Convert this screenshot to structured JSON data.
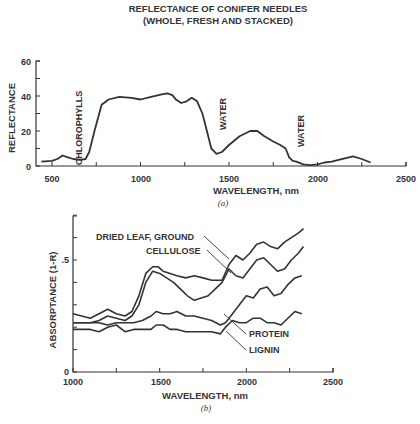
{
  "chart_data": [
    {
      "type": "line",
      "panel": "(a)",
      "title": "REFLECTANCE OF CONIFER NEEDLES",
      "subtitle": "(WHOLE, FRESH AND STACKED)",
      "xlabel": "WAVELENGTH, nm",
      "ylabel": "REFLECTANCE",
      "xlim": [
        400,
        2500
      ],
      "ylim": [
        0,
        60
      ],
      "xticks": [
        500,
        1000,
        1500,
        2000,
        2500
      ],
      "yticks": [
        0,
        20,
        40,
        60
      ],
      "grid": false,
      "annotations": [
        {
          "text": "CHLOROPHYLLS",
          "x": 680,
          "y": 12
        },
        {
          "text": "WATER",
          "x": 1420,
          "y": 18
        },
        {
          "text": "WATER",
          "x": 1900,
          "y": 12
        }
      ],
      "series": [
        {
          "name": "Conifer needles reflectance",
          "x": [
            440,
            500,
            530,
            560,
            590,
            620,
            660,
            690,
            710,
            740,
            780,
            820,
            880,
            950,
            1000,
            1060,
            1120,
            1150,
            1180,
            1200,
            1230,
            1260,
            1290,
            1320,
            1350,
            1380,
            1400,
            1430,
            1460,
            1500,
            1560,
            1620,
            1660,
            1700,
            1750,
            1790,
            1820,
            1840,
            1860,
            1880,
            1920,
            1960,
            2000,
            2040,
            2080,
            2120,
            2160,
            2200,
            2250,
            2300
          ],
          "y": [
            2.5,
            3,
            4,
            6,
            5,
            4,
            3.5,
            4,
            8,
            20,
            35,
            38,
            39.5,
            39,
            38,
            39.5,
            41,
            41.5,
            40.5,
            38,
            36,
            37,
            39,
            37,
            30,
            18,
            10,
            7,
            8,
            12,
            17,
            20,
            20,
            17,
            14,
            12,
            10,
            5,
            3,
            2.5,
            1,
            0.5,
            1,
            2,
            2.5,
            3.5,
            4.5,
            5.5,
            4,
            2
          ]
        }
      ]
    },
    {
      "type": "line",
      "panel": "(b)",
      "xlabel": "WAVELENGTH, nm",
      "ylabel": "ABSORPTANCE (1-R)",
      "xlim": [
        1000,
        2500
      ],
      "ylim": [
        0,
        0.75
      ],
      "xticks": [
        1000,
        1500,
        2000,
        2500
      ],
      "xminor": [
        1250,
        1750,
        2250
      ],
      "yticks": [
        0,
        0.5
      ],
      "ytick_labels": [
        "0",
        ".5"
      ],
      "grid": false,
      "legend": "inline leader-line labels",
      "series": [
        {
          "name": "DRIED LEAF, GROUND",
          "x": [
            1000,
            1050,
            1100,
            1150,
            1200,
            1250,
            1300,
            1340,
            1380,
            1420,
            1460,
            1490,
            1520,
            1560,
            1600,
            1650,
            1700,
            1750,
            1800,
            1860,
            1900,
            1940,
            1980,
            2020,
            2060,
            2100,
            2140,
            2180,
            2220,
            2260,
            2300,
            2330
          ],
          "y": [
            0.26,
            0.25,
            0.24,
            0.26,
            0.28,
            0.26,
            0.25,
            0.27,
            0.34,
            0.44,
            0.47,
            0.47,
            0.45,
            0.44,
            0.43,
            0.42,
            0.43,
            0.42,
            0.41,
            0.41,
            0.48,
            0.52,
            0.5,
            0.53,
            0.57,
            0.58,
            0.56,
            0.55,
            0.58,
            0.6,
            0.62,
            0.64
          ]
        },
        {
          "name": "CELLULOSE",
          "x": [
            1000,
            1050,
            1100,
            1150,
            1200,
            1250,
            1300,
            1340,
            1380,
            1420,
            1460,
            1500,
            1540,
            1580,
            1620,
            1660,
            1700,
            1740,
            1780,
            1820,
            1860,
            1900,
            1940,
            1980,
            2020,
            2060,
            2100,
            2140,
            2180,
            2220,
            2260,
            2300,
            2330
          ],
          "y": [
            0.22,
            0.22,
            0.22,
            0.23,
            0.25,
            0.24,
            0.23,
            0.25,
            0.3,
            0.4,
            0.45,
            0.44,
            0.42,
            0.4,
            0.37,
            0.34,
            0.32,
            0.33,
            0.34,
            0.37,
            0.4,
            0.46,
            0.43,
            0.42,
            0.46,
            0.5,
            0.51,
            0.48,
            0.45,
            0.46,
            0.5,
            0.53,
            0.56
          ]
        },
        {
          "name": "PROTEIN",
          "x": [
            1000,
            1050,
            1100,
            1150,
            1200,
            1250,
            1300,
            1350,
            1400,
            1450,
            1480,
            1520,
            1560,
            1600,
            1650,
            1700,
            1750,
            1800,
            1850,
            1880,
            1920,
            1960,
            2000,
            2040,
            2080,
            2120,
            2160,
            2200,
            2240,
            2280,
            2320
          ],
          "y": [
            0.22,
            0.22,
            0.22,
            0.22,
            0.21,
            0.22,
            0.22,
            0.22,
            0.23,
            0.25,
            0.27,
            0.26,
            0.26,
            0.27,
            0.25,
            0.25,
            0.24,
            0.23,
            0.21,
            0.22,
            0.26,
            0.3,
            0.34,
            0.33,
            0.37,
            0.38,
            0.34,
            0.35,
            0.39,
            0.42,
            0.43
          ]
        },
        {
          "name": "LIGNIN",
          "x": [
            1000,
            1050,
            1100,
            1150,
            1200,
            1250,
            1300,
            1350,
            1400,
            1450,
            1480,
            1520,
            1560,
            1600,
            1650,
            1700,
            1750,
            1800,
            1850,
            1880,
            1920,
            1960,
            2000,
            2040,
            2080,
            2120,
            2160,
            2200,
            2240,
            2280,
            2320
          ],
          "y": [
            0.19,
            0.19,
            0.19,
            0.18,
            0.2,
            0.21,
            0.18,
            0.19,
            0.19,
            0.19,
            0.21,
            0.21,
            0.19,
            0.19,
            0.18,
            0.18,
            0.18,
            0.18,
            0.17,
            0.2,
            0.23,
            0.22,
            0.22,
            0.24,
            0.24,
            0.22,
            0.22,
            0.21,
            0.24,
            0.27,
            0.26
          ]
        }
      ]
    }
  ],
  "labels": {
    "title_line1": "REFLECTANCE OF CONIFER NEEDLES",
    "title_line2": "(WHOLE, FRESH AND STACKED)",
    "a": {
      "ylabel": "REFLECTANCE",
      "xlabel": "WAVELENGTH, nm",
      "panel": "(a)",
      "yticks": [
        "0",
        "20",
        "40",
        "60"
      ],
      "xticks": [
        "500",
        "1000",
        "1500",
        "2000",
        "2500"
      ],
      "ann_chloro": "CHLOROPHYLLS",
      "ann_water1": "WATER",
      "ann_water2": "WATER"
    },
    "b": {
      "ylabel": "ABSORPTANCE (1-R)",
      "xlabel": "WAVELENGTH, nm",
      "panel": "(b)",
      "yticks": [
        "0",
        ".5"
      ],
      "xticks": [
        "1000",
        "1500",
        "2000",
        "2500"
      ],
      "leg_dried": "DRIED LEAF, GROUND",
      "leg_cell": "CELLULOSE",
      "leg_protein": "PROTEIN",
      "leg_lignin": "LIGNIN"
    }
  }
}
